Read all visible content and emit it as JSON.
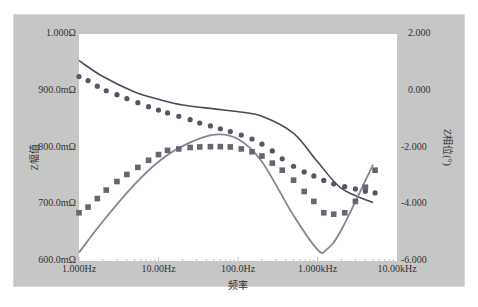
{
  "chart_data": {
    "type": "line",
    "title": "",
    "xlabel": "频率",
    "ylabel_left": "Z幅值",
    "ylabel_right": "Z相位(°)",
    "x_scale": "log",
    "x_ticks": [
      "1.000Hz",
      "10.00Hz",
      "100.0Hz",
      "1.000kHz",
      "10.00kHz"
    ],
    "x_tick_values": [
      1,
      10,
      100,
      1000,
      10000
    ],
    "y_left_ticks": [
      "1.000Ω",
      "900.0mΩ",
      "800.0mΩ",
      "700.0mΩ",
      "600.0mΩ"
    ],
    "y_left_range": [
      0.6,
      1.0
    ],
    "y_right_ticks": [
      "2.000",
      "0.000",
      "-2.000",
      "-4.000",
      "-6.000"
    ],
    "y_right_range": [
      -6.0,
      2.0
    ],
    "grid": false,
    "legend": "none",
    "series": [
      {
        "name": "Magnitude (fit, solid line)",
        "axis": "left",
        "style": "line",
        "color": "#4a4a5a",
        "x": [
          1,
          2,
          5,
          10,
          20,
          50,
          100,
          200,
          500,
          1000,
          2000,
          5000
        ],
        "y": [
          0.953,
          0.925,
          0.898,
          0.885,
          0.875,
          0.868,
          0.863,
          0.855,
          0.825,
          0.775,
          0.728,
          0.703
        ]
      },
      {
        "name": "Magnitude (measured, dots)",
        "axis": "left",
        "style": "circle",
        "color": "#555566",
        "x": [
          1,
          1.3,
          1.7,
          2.2,
          3,
          4,
          5.5,
          7.5,
          10,
          13,
          18,
          25,
          33,
          45,
          60,
          80,
          110,
          150,
          200,
          270,
          360,
          500,
          680,
          900,
          1200,
          1600,
          2200,
          3000,
          4000,
          5300
        ],
        "y": [
          0.925,
          0.918,
          0.908,
          0.9,
          0.893,
          0.886,
          0.879,
          0.872,
          0.866,
          0.861,
          0.855,
          0.849,
          0.843,
          0.838,
          0.833,
          0.828,
          0.822,
          0.815,
          0.806,
          0.794,
          0.78,
          0.767,
          0.757,
          0.75,
          0.742,
          0.736,
          0.731,
          0.727,
          0.723,
          0.72
        ]
      },
      {
        "name": "Phase (fit, solid line)",
        "axis": "right",
        "style": "line",
        "color": "#808890",
        "x": [
          1,
          2,
          5,
          10,
          20,
          50,
          100,
          200,
          500,
          1000,
          1300,
          2000,
          5000
        ],
        "y": [
          -5.7,
          -4.6,
          -3.3,
          -2.5,
          -1.95,
          -1.55,
          -1.7,
          -2.5,
          -4.4,
          -5.6,
          -5.6,
          -4.9,
          -2.6
        ]
      },
      {
        "name": "Phase (measured, squares)",
        "axis": "right",
        "style": "square",
        "color": "#666670",
        "x": [
          1,
          1.3,
          1.7,
          2.2,
          3,
          4,
          5.5,
          7.5,
          10,
          13,
          18,
          25,
          33,
          45,
          60,
          80,
          110,
          150,
          200,
          270,
          360,
          500,
          680,
          900,
          1200,
          1600,
          2200,
          3000,
          4000,
          5300
        ],
        "y": [
          -4.3,
          -4.1,
          -3.8,
          -3.5,
          -3.2,
          -2.95,
          -2.7,
          -2.45,
          -2.25,
          -2.1,
          -2.05,
          -2.0,
          -1.98,
          -1.97,
          -1.97,
          -1.98,
          -2.05,
          -2.15,
          -2.3,
          -2.55,
          -2.8,
          -3.15,
          -3.55,
          -3.9,
          -4.3,
          -4.35,
          -4.3,
          -3.9,
          -3.4,
          -2.8
        ]
      }
    ]
  },
  "axes": {
    "x_title": "频率",
    "y_left_title": "Z幅值",
    "y_right_title": "Z相位(°)"
  }
}
